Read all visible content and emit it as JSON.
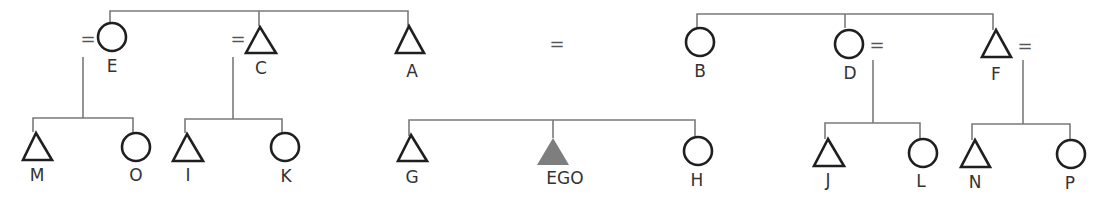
{
  "diagram": {
    "type": "kinship-chart",
    "marriage_symbol": "=",
    "colors": {
      "line": "#7a7a7a",
      "shape_stroke": "#1f1f1f",
      "ego_fill": "#7e7e7e",
      "label": "#333333"
    },
    "parent_generation": {
      "left_sibling_group": [
        {
          "id": "E",
          "label": "E",
          "sex": "female",
          "shape": "circle",
          "married": true
        },
        {
          "id": "C",
          "label": "C",
          "sex": "male",
          "shape": "triangle",
          "married": true
        },
        {
          "id": "A",
          "label": "A",
          "sex": "male",
          "shape": "triangle",
          "married_to": "B"
        }
      ],
      "right_sibling_group": [
        {
          "id": "B",
          "label": "B",
          "sex": "female",
          "shape": "circle",
          "married_to": "A"
        },
        {
          "id": "D",
          "label": "D",
          "sex": "female",
          "shape": "circle",
          "married": true
        },
        {
          "id": "F",
          "label": "F",
          "sex": "male",
          "shape": "triangle",
          "married": true
        }
      ]
    },
    "child_generation": [
      {
        "parent": "E",
        "children": [
          {
            "id": "M",
            "label": "M",
            "sex": "male",
            "shape": "triangle"
          },
          {
            "id": "O",
            "label": "O",
            "sex": "female",
            "shape": "circle"
          }
        ]
      },
      {
        "parent": "C",
        "children": [
          {
            "id": "I",
            "label": "I",
            "sex": "male",
            "shape": "triangle"
          },
          {
            "id": "K",
            "label": "K",
            "sex": "female",
            "shape": "circle"
          }
        ]
      },
      {
        "parent": "A=B",
        "children": [
          {
            "id": "G",
            "label": "G",
            "sex": "male",
            "shape": "triangle"
          },
          {
            "id": "EGO",
            "label": "EGO",
            "sex": "male",
            "shape": "triangle",
            "filled": true
          },
          {
            "id": "H",
            "label": "H",
            "sex": "female",
            "shape": "circle"
          }
        ]
      },
      {
        "parent": "D",
        "children": [
          {
            "id": "J",
            "label": "J",
            "sex": "male",
            "shape": "triangle"
          },
          {
            "id": "L",
            "label": "L",
            "sex": "female",
            "shape": "circle"
          }
        ]
      },
      {
        "parent": "F",
        "children": [
          {
            "id": "N",
            "label": "N",
            "sex": "male",
            "shape": "triangle"
          },
          {
            "id": "P",
            "label": "P",
            "sex": "female",
            "shape": "circle"
          }
        ]
      }
    ],
    "labels": {
      "E": "E",
      "C": "C",
      "A": "A",
      "B": "B",
      "D": "D",
      "F": "F",
      "M": "M",
      "O": "O",
      "I": "I",
      "K": "K",
      "G": "G",
      "EGO": "EGO",
      "H": "H",
      "J": "J",
      "L": "L",
      "N": "N",
      "P": "P"
    },
    "eq": "="
  }
}
